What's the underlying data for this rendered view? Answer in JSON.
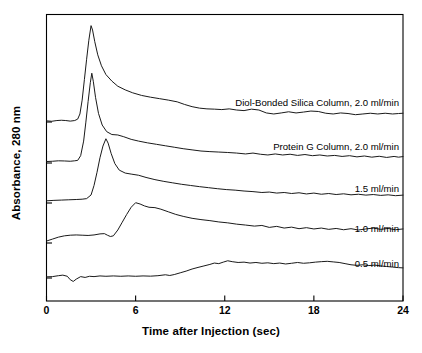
{
  "chart_data": {
    "type": "line",
    "title": "",
    "xlabel": "Time after Injection (sec)",
    "ylabel": "Absorbance, 280 nm",
    "xlim": [
      0,
      24
    ],
    "xticks": [
      0,
      6,
      12,
      18,
      24
    ],
    "xtick_labels": [
      "0",
      "6",
      "12",
      "18",
      "24"
    ],
    "yticks": [],
    "ytick_labels": [],
    "grid": false,
    "legend_position": "inline-right",
    "series": [
      {
        "name": "Diol-Bonded Silica Column, 2.0 ml/min",
        "baseline": 0.0,
        "peak_time": 3.0,
        "peak_height": 6.6,
        "points": [
          [
            0.0,
            0.08
          ],
          [
            0.35,
            0.05
          ],
          [
            0.7,
            0.1
          ],
          [
            1.0,
            0.12
          ],
          [
            1.3,
            0.1
          ],
          [
            1.6,
            0.06
          ],
          [
            1.9,
            0.1
          ],
          [
            2.1,
            0.2
          ],
          [
            2.25,
            0.55
          ],
          [
            2.4,
            1.5
          ],
          [
            2.55,
            2.9
          ],
          [
            2.7,
            4.3
          ],
          [
            2.85,
            5.6
          ],
          [
            3.0,
            6.6
          ],
          [
            3.1,
            6.3
          ],
          [
            3.25,
            5.5
          ],
          [
            3.45,
            4.6
          ],
          [
            3.7,
            3.85
          ],
          [
            4.0,
            3.25
          ],
          [
            4.4,
            2.8
          ],
          [
            4.8,
            2.45
          ],
          [
            5.3,
            2.2
          ],
          [
            5.8,
            2.0
          ],
          [
            6.4,
            1.82
          ],
          [
            7.0,
            1.7
          ],
          [
            7.6,
            1.6
          ],
          [
            8.2,
            1.5
          ],
          [
            8.8,
            1.38
          ],
          [
            9.3,
            1.2
          ],
          [
            9.8,
            1.05
          ],
          [
            10.3,
            0.95
          ],
          [
            10.8,
            0.9
          ],
          [
            11.3,
            0.88
          ],
          [
            11.8,
            0.85
          ],
          [
            12.3,
            0.9
          ],
          [
            12.8,
            0.82
          ],
          [
            13.3,
            0.78
          ],
          [
            13.8,
            0.88
          ],
          [
            14.3,
            0.82
          ],
          [
            14.8,
            0.62
          ],
          [
            15.3,
            0.55
          ],
          [
            15.8,
            0.62
          ],
          [
            16.3,
            0.7
          ],
          [
            16.8,
            0.62
          ],
          [
            17.3,
            0.68
          ],
          [
            17.8,
            0.75
          ],
          [
            18.3,
            0.72
          ],
          [
            18.8,
            0.6
          ],
          [
            19.3,
            0.55
          ],
          [
            19.8,
            0.62
          ],
          [
            20.3,
            0.58
          ],
          [
            20.8,
            0.5
          ],
          [
            21.3,
            0.55
          ],
          [
            21.8,
            0.6
          ],
          [
            22.3,
            0.55
          ],
          [
            22.8,
            0.6
          ],
          [
            23.3,
            0.55
          ],
          [
            23.7,
            0.58
          ],
          [
            24.0,
            0.6
          ]
        ]
      },
      {
        "name": "Protein G Column, 2.0 ml/min",
        "baseline": 0.0,
        "peak_time": 3.05,
        "peak_height": 6.15,
        "points": [
          [
            0.0,
            0.1
          ],
          [
            0.4,
            0.12
          ],
          [
            0.8,
            0.15
          ],
          [
            1.2,
            0.14
          ],
          [
            1.6,
            0.12
          ],
          [
            1.9,
            0.15
          ],
          [
            2.1,
            0.18
          ],
          [
            2.3,
            0.5
          ],
          [
            2.5,
            1.5
          ],
          [
            2.65,
            2.8
          ],
          [
            2.8,
            4.2
          ],
          [
            2.95,
            5.5
          ],
          [
            3.05,
            6.15
          ],
          [
            3.15,
            5.6
          ],
          [
            3.3,
            4.5
          ],
          [
            3.5,
            3.4
          ],
          [
            3.75,
            2.6
          ],
          [
            4.05,
            2.15
          ],
          [
            4.4,
            1.95
          ],
          [
            4.8,
            1.92
          ],
          [
            5.2,
            1.8
          ],
          [
            5.7,
            1.62
          ],
          [
            6.2,
            1.5
          ],
          [
            6.8,
            1.38
          ],
          [
            7.4,
            1.28
          ],
          [
            8.0,
            1.18
          ],
          [
            8.6,
            1.08
          ],
          [
            9.2,
            0.98
          ],
          [
            9.8,
            0.9
          ],
          [
            10.4,
            0.82
          ],
          [
            11.0,
            0.78
          ],
          [
            11.6,
            0.75
          ],
          [
            12.2,
            0.72
          ],
          [
            12.8,
            0.68
          ],
          [
            13.4,
            0.62
          ],
          [
            13.9,
            0.68
          ],
          [
            14.4,
            0.6
          ],
          [
            14.9,
            0.55
          ],
          [
            15.4,
            0.62
          ],
          [
            15.9,
            0.55
          ],
          [
            16.4,
            0.6
          ],
          [
            16.9,
            0.52
          ],
          [
            17.4,
            0.58
          ],
          [
            17.9,
            0.5
          ],
          [
            18.4,
            0.55
          ],
          [
            18.9,
            0.48
          ],
          [
            19.4,
            0.52
          ],
          [
            19.9,
            0.45
          ],
          [
            20.4,
            0.5
          ],
          [
            20.9,
            0.42
          ],
          [
            21.4,
            0.48
          ],
          [
            21.9,
            0.4
          ],
          [
            22.4,
            0.46
          ],
          [
            22.9,
            0.38
          ],
          [
            23.4,
            0.45
          ],
          [
            23.7,
            0.4
          ],
          [
            24.0,
            0.44
          ]
        ]
      },
      {
        "name": "1.5 ml/min",
        "baseline": 0.0,
        "peak_time": 4.0,
        "peak_height": 4.4,
        "points": [
          [
            0.0,
            0.15
          ],
          [
            0.5,
            0.18
          ],
          [
            1.0,
            0.2
          ],
          [
            1.5,
            0.22
          ],
          [
            2.0,
            0.24
          ],
          [
            2.4,
            0.26
          ],
          [
            2.7,
            0.3
          ],
          [
            3.0,
            0.55
          ],
          [
            3.2,
            1.2
          ],
          [
            3.4,
            2.1
          ],
          [
            3.6,
            3.1
          ],
          [
            3.8,
            3.9
          ],
          [
            4.0,
            4.4
          ],
          [
            4.15,
            4.1
          ],
          [
            4.35,
            3.4
          ],
          [
            4.6,
            2.7
          ],
          [
            4.9,
            2.25
          ],
          [
            5.3,
            2.05
          ],
          [
            5.7,
            1.98
          ],
          [
            6.2,
            1.9
          ],
          [
            6.7,
            1.75
          ],
          [
            7.3,
            1.6
          ],
          [
            7.9,
            1.48
          ],
          [
            8.5,
            1.38
          ],
          [
            9.1,
            1.28
          ],
          [
            9.7,
            1.2
          ],
          [
            10.3,
            1.12
          ],
          [
            10.9,
            1.05
          ],
          [
            11.5,
            0.98
          ],
          [
            12.1,
            0.92
          ],
          [
            12.7,
            0.88
          ],
          [
            13.3,
            0.82
          ],
          [
            13.9,
            0.78
          ],
          [
            14.5,
            0.72
          ],
          [
            15.0,
            0.75
          ],
          [
            15.5,
            0.68
          ],
          [
            16.0,
            0.72
          ],
          [
            16.5,
            0.65
          ],
          [
            17.0,
            0.7
          ],
          [
            17.5,
            0.62
          ],
          [
            18.0,
            0.68
          ],
          [
            18.5,
            0.6
          ],
          [
            19.0,
            0.65
          ],
          [
            19.5,
            0.58
          ],
          [
            20.0,
            0.63
          ],
          [
            20.5,
            0.56
          ],
          [
            21.0,
            0.6
          ],
          [
            21.5,
            0.54
          ],
          [
            22.0,
            0.58
          ],
          [
            22.5,
            0.52
          ],
          [
            23.0,
            0.56
          ],
          [
            23.5,
            0.5
          ],
          [
            24.0,
            0.54
          ]
        ]
      },
      {
        "name": "1.0 ml/min",
        "baseline": 0.0,
        "peak_time": 6.0,
        "peak_height": 3.1,
        "points": [
          [
            0.0,
            0.15
          ],
          [
            0.4,
            0.3
          ],
          [
            0.8,
            0.45
          ],
          [
            1.2,
            0.55
          ],
          [
            1.6,
            0.6
          ],
          [
            2.0,
            0.62
          ],
          [
            2.4,
            0.6
          ],
          [
            2.8,
            0.58
          ],
          [
            3.2,
            0.62
          ],
          [
            3.6,
            0.7
          ],
          [
            3.9,
            0.72
          ],
          [
            4.1,
            0.6
          ],
          [
            4.3,
            0.5
          ],
          [
            4.5,
            0.55
          ],
          [
            4.8,
            1.0
          ],
          [
            5.1,
            1.6
          ],
          [
            5.4,
            2.2
          ],
          [
            5.7,
            2.75
          ],
          [
            6.0,
            3.1
          ],
          [
            6.3,
            3.0
          ],
          [
            6.6,
            2.85
          ],
          [
            6.9,
            2.75
          ],
          [
            7.3,
            2.72
          ],
          [
            7.7,
            2.6
          ],
          [
            8.2,
            2.4
          ],
          [
            8.7,
            2.2
          ],
          [
            9.2,
            2.05
          ],
          [
            9.8,
            1.9
          ],
          [
            10.4,
            1.8
          ],
          [
            11.0,
            1.72
          ],
          [
            11.6,
            1.62
          ],
          [
            12.2,
            1.55
          ],
          [
            12.8,
            1.45
          ],
          [
            13.4,
            1.38
          ],
          [
            14.0,
            1.3
          ],
          [
            14.5,
            1.35
          ],
          [
            15.0,
            1.2
          ],
          [
            15.5,
            1.28
          ],
          [
            16.0,
            1.15
          ],
          [
            16.5,
            1.22
          ],
          [
            17.0,
            1.1
          ],
          [
            17.5,
            1.18
          ],
          [
            18.0,
            1.08
          ],
          [
            18.5,
            1.15
          ],
          [
            19.0,
            1.05
          ],
          [
            19.5,
            1.12
          ],
          [
            20.0,
            1.02
          ],
          [
            20.5,
            1.1
          ],
          [
            21.0,
            1.0
          ],
          [
            21.5,
            1.08
          ],
          [
            22.0,
            1.15
          ],
          [
            22.5,
            1.05
          ],
          [
            23.0,
            1.12
          ],
          [
            23.5,
            1.02
          ],
          [
            24.0,
            1.08
          ]
        ]
      },
      {
        "name": "0.5 ml/min",
        "baseline": 0.0,
        "peak_time": 12.2,
        "peak_height": 1.5,
        "points": [
          [
            0.0,
            0.1
          ],
          [
            0.4,
            0.12
          ],
          [
            0.8,
            0.2
          ],
          [
            1.1,
            0.25
          ],
          [
            1.4,
            0.15
          ],
          [
            1.6,
            -0.15
          ],
          [
            1.8,
            -0.3
          ],
          [
            2.0,
            -0.1
          ],
          [
            2.3,
            0.12
          ],
          [
            2.6,
            0.05
          ],
          [
            2.9,
            0.15
          ],
          [
            3.2,
            0.12
          ],
          [
            3.6,
            0.18
          ],
          [
            4.0,
            0.15
          ],
          [
            4.5,
            0.18
          ],
          [
            5.0,
            0.15
          ],
          [
            5.5,
            0.18
          ],
          [
            6.0,
            0.15
          ],
          [
            6.5,
            0.18
          ],
          [
            7.0,
            0.16
          ],
          [
            7.5,
            0.2
          ],
          [
            8.0,
            0.28
          ],
          [
            8.3,
            0.22
          ],
          [
            8.6,
            0.3
          ],
          [
            9.0,
            0.45
          ],
          [
            9.4,
            0.6
          ],
          [
            9.8,
            0.78
          ],
          [
            10.2,
            0.92
          ],
          [
            10.6,
            1.05
          ],
          [
            11.0,
            1.18
          ],
          [
            11.3,
            1.3
          ],
          [
            11.6,
            1.25
          ],
          [
            11.9,
            1.38
          ],
          [
            12.2,
            1.5
          ],
          [
            12.5,
            1.42
          ],
          [
            12.9,
            1.35
          ],
          [
            13.3,
            1.38
          ],
          [
            13.7,
            1.3
          ],
          [
            14.1,
            1.35
          ],
          [
            14.5,
            1.28
          ],
          [
            14.9,
            1.32
          ],
          [
            15.3,
            1.25
          ],
          [
            15.7,
            1.3
          ],
          [
            16.1,
            1.22
          ],
          [
            16.5,
            1.28
          ],
          [
            16.9,
            1.35
          ],
          [
            17.3,
            1.28
          ],
          [
            17.7,
            1.32
          ],
          [
            18.1,
            1.38
          ],
          [
            18.5,
            1.42
          ],
          [
            18.9,
            1.45
          ],
          [
            19.3,
            1.4
          ],
          [
            19.7,
            1.35
          ],
          [
            20.1,
            1.25
          ],
          [
            20.5,
            1.15
          ],
          [
            20.9,
            1.1
          ],
          [
            21.3,
            1.15
          ],
          [
            21.7,
            1.08
          ],
          [
            22.1,
            1.12
          ],
          [
            22.5,
            1.05
          ],
          [
            22.9,
            1.0
          ],
          [
            23.3,
            0.95
          ],
          [
            23.7,
            0.9
          ],
          [
            24.0,
            0.88
          ]
        ]
      }
    ]
  },
  "axes": {
    "x_title": "Time after Injection (sec)",
    "y_title": "Absorbance, 280 nm",
    "x_tick_labels": [
      "0",
      "6",
      "12",
      "18",
      "24"
    ]
  },
  "trace_labels": [
    "Diol-Bonded Silica Column, 2.0 ml/min",
    "Protein G Column, 2.0 ml/min",
    "1.5 ml/min",
    "1.0 ml/min",
    "0.5 ml/min"
  ],
  "style": {
    "line_color": "#1a1a1a",
    "axis_color": "#000000",
    "background": "#ffffff"
  }
}
